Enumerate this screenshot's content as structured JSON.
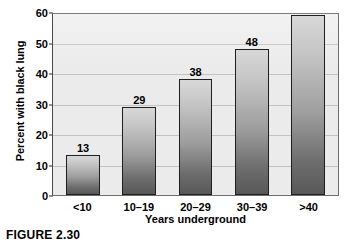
{
  "figure": {
    "caption": "FIGURE 2.30"
  },
  "chart_data": {
    "type": "bar",
    "title": "",
    "xlabel": "Years underground",
    "ylabel": "Percent with black lung",
    "categories": [
      "<10",
      "10–19",
      "20–29",
      "30–39",
      ">40"
    ],
    "values": [
      13,
      29,
      38,
      48,
      59
    ],
    "value_labels": [
      "13",
      "29",
      "38",
      "48",
      "59"
    ],
    "ylim": [
      0,
      60
    ],
    "ytick_values": [
      0,
      10,
      20,
      30,
      40,
      50,
      60
    ],
    "ytick_labels": [
      "0",
      "10",
      "20",
      "30",
      "40",
      "50",
      "60"
    ],
    "grid": "horizontal",
    "legend": "none",
    "colors": {
      "plot_background": "#ebebeb",
      "frame": "#6e6e6e",
      "gridline": "#c2c2c2",
      "bar_top": "#d8d8d8",
      "bar_bottom": "#585858",
      "bar_outline": "#1f1f1f",
      "text": "#000000"
    }
  }
}
